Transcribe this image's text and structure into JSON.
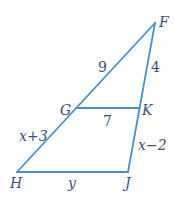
{
  "diagram": {
    "type": "geometry-triangle",
    "line_color": "#4a90c8",
    "label_color": "#3a4f78",
    "vertices": {
      "F": {
        "label": "F",
        "x": 155,
        "y": 23
      },
      "G": {
        "label": "G",
        "x": 76,
        "y": 108
      },
      "K": {
        "label": "K",
        "x": 139,
        "y": 108
      },
      "H": {
        "label": "H",
        "x": 17,
        "y": 172
      },
      "J": {
        "label": "J",
        "x": 128,
        "y": 172
      }
    },
    "segments": [
      {
        "from": "F",
        "to": "G",
        "label": "9"
      },
      {
        "from": "F",
        "to": "K",
        "label": "4"
      },
      {
        "from": "G",
        "to": "K",
        "label": "7"
      },
      {
        "from": "G",
        "to": "H",
        "label": "x+3"
      },
      {
        "from": "K",
        "to": "J",
        "label": "x−2"
      },
      {
        "from": "H",
        "to": "J",
        "label": "y"
      }
    ]
  }
}
